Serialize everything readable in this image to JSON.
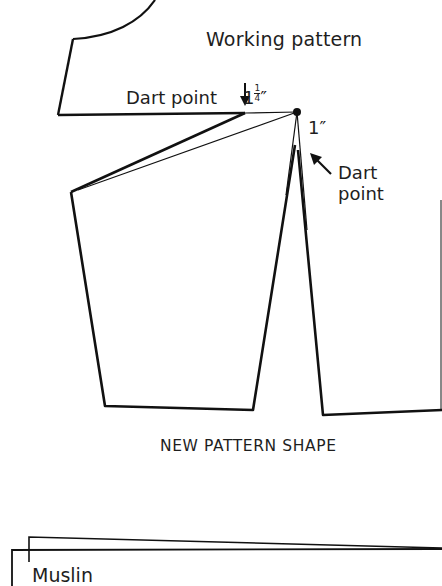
{
  "diagram": {
    "title": "Working pattern",
    "labels": {
      "dart_point_top": "Dart point",
      "measure_top_whole": "1",
      "measure_top_num": "1",
      "measure_top_den": "4",
      "measure_top_unit": "″",
      "measure_right": "1″",
      "dart_point_right_line1": "Dart",
      "dart_point_right_line2": "point",
      "caption": "NEW PATTERN SHAPE",
      "muslin": "Muslin"
    },
    "icons": {
      "arrow_down": "down-arrow-icon",
      "arrow_upleft": "up-left-arrow-icon"
    },
    "colors": {
      "line": "#111111",
      "text": "#1e1e1e",
      "background": "#ffffff"
    }
  }
}
